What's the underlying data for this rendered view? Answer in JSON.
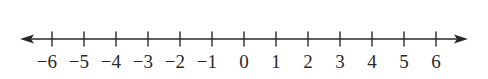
{
  "diagram": {
    "type": "number-line",
    "min": -6,
    "max": 6,
    "step": 1,
    "arrows": [
      "left",
      "right"
    ],
    "ticks": [
      {
        "value": -6,
        "label": "−6"
      },
      {
        "value": -5,
        "label": "−5"
      },
      {
        "value": -4,
        "label": "−4"
      },
      {
        "value": -3,
        "label": "−3"
      },
      {
        "value": -2,
        "label": "−2"
      },
      {
        "value": -1,
        "label": "−1"
      },
      {
        "value": 0,
        "label": "0"
      },
      {
        "value": 1,
        "label": "1"
      },
      {
        "value": 2,
        "label": "2"
      },
      {
        "value": 3,
        "label": "3"
      },
      {
        "value": 4,
        "label": "4"
      },
      {
        "value": 5,
        "label": "5"
      },
      {
        "value": 6,
        "label": "6"
      }
    ],
    "colors": {
      "line": "#2a2a2a",
      "background": "#ffffff"
    }
  }
}
